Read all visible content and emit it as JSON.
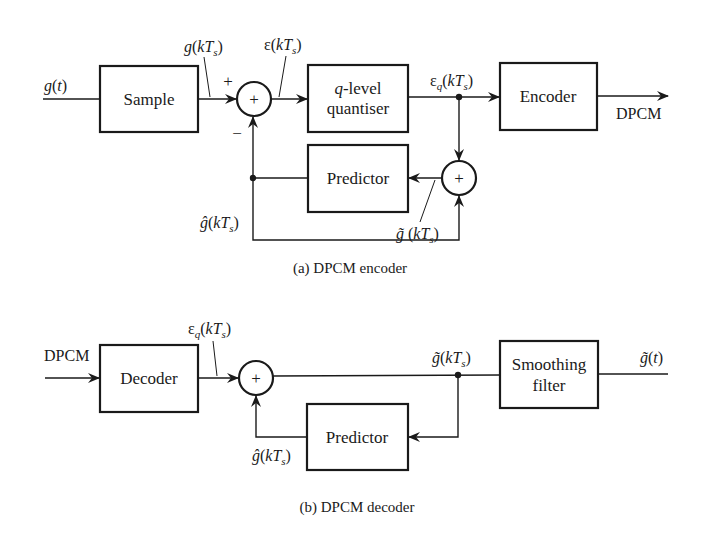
{
  "encoder": {
    "caption": "(a) DPCM encoder",
    "input_label": "g(t)",
    "blocks": {
      "sample": "Sample",
      "quantiser_line1": "q-level",
      "quantiser_line1_italic": "q",
      "quantiser_line1_rest": "-level",
      "quantiser_line2": "quantiser",
      "encoder": "Encoder",
      "predictor": "Predictor"
    },
    "summer_symbol": "+",
    "summer2_symbol": "+",
    "plus_sign": "+",
    "minus_sign": "−",
    "signals": {
      "sampled": "g(kTs)",
      "error": "ε(kTs)",
      "quantised_error": "εq(kTs)",
      "prediction": "ĝ(kTs)",
      "reconstructed": "g̃ (kTs)"
    },
    "output_label": "DPCM"
  },
  "decoder": {
    "caption": "(b) DPCM decoder",
    "input_label": "DPCM",
    "blocks": {
      "decoder": "Decoder",
      "predictor": "Predictor",
      "smoothing_line1": "Smoothing",
      "smoothing_line2": "filter"
    },
    "summer_symbol": "+",
    "signals": {
      "quantised_error": "εq(kTs)",
      "reconstructed": "g̃(kTs)",
      "prediction": "ĝ(kTs)",
      "output": "g̃(t)"
    }
  }
}
